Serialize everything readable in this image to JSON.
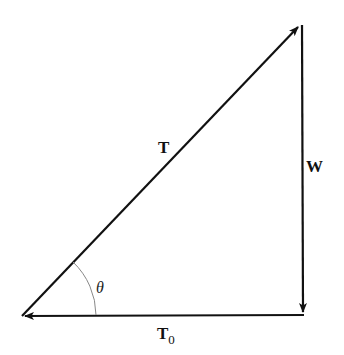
{
  "diagram": {
    "type": "force-triangle",
    "vectors": [
      {
        "id": "T",
        "label": "T",
        "subscript": "",
        "from": [
          22,
          316
        ],
        "to": [
          300,
          25
        ],
        "direction": "up-right"
      },
      {
        "id": "W",
        "label": "W",
        "subscript": "",
        "from": [
          302,
          25
        ],
        "to": [
          303,
          314
        ],
        "direction": "down"
      },
      {
        "id": "T0",
        "label": "T",
        "subscript": "0",
        "from": [
          303,
          315
        ],
        "to": [
          22,
          316
        ],
        "direction": "left"
      }
    ],
    "angle": {
      "label": "θ",
      "vertex": [
        22,
        316
      ],
      "between": [
        "T",
        "T0"
      ]
    },
    "colors": {
      "line": "#111111",
      "arc": "#777777",
      "background": "#ffffff"
    }
  },
  "labels": {
    "T": "T",
    "W": "W",
    "T0_main": "T",
    "T0_sub": "0",
    "theta": "θ"
  }
}
